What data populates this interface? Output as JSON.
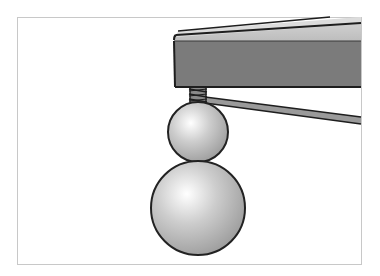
{
  "diagram": {
    "frame": {
      "x": 17,
      "y": 17,
      "width": 345,
      "height": 248,
      "stroke": "#c8c8c8"
    },
    "table": {
      "front_face_color": "#7b7b7b",
      "top_face_color": "#bdbdbd",
      "top_highlight_color": "#d8d8d8",
      "outline_color": "#1e1e1e"
    },
    "spring": {
      "color": "#8a8a8a",
      "coils": 3
    },
    "rod": {
      "color": "#9a9a9a"
    },
    "spheres": [
      {
        "name": "upper-sphere",
        "cx": 198,
        "cy": 132,
        "r": 30
      },
      {
        "name": "lower-sphere",
        "cx": 198,
        "cy": 208,
        "r": 47
      }
    ],
    "sphere_colors": {
      "highlight": "#ffffff",
      "mid": "#c4c4c4",
      "shadow": "#9e9e9e",
      "outline": "#222222"
    },
    "labels": []
  }
}
